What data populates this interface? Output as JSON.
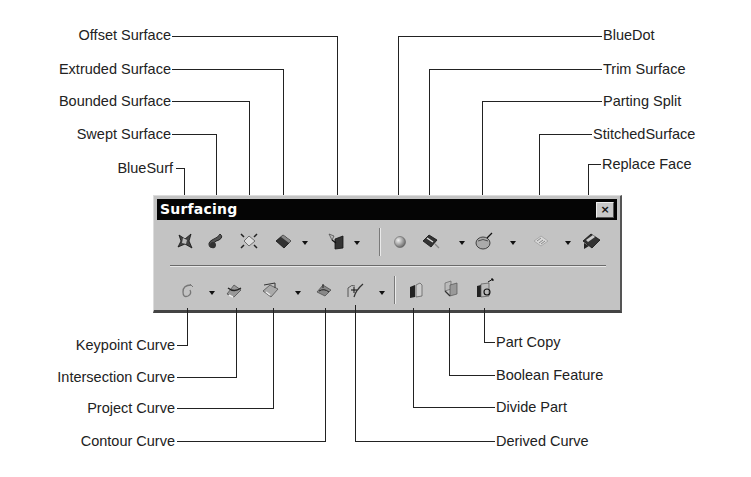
{
  "toolbar": {
    "title": "Surfacing",
    "close_glyph": "×",
    "row1": [
      {
        "name": "BlueSurf",
        "icon": "bluesurf-icon"
      },
      {
        "name": "Swept Surface",
        "icon": "swept-surface-icon"
      },
      {
        "name": "Bounded Surface",
        "icon": "bounded-surface-icon"
      },
      {
        "name": "Extruded Surface",
        "icon": "extruded-surface-icon",
        "dropdown": true
      },
      {
        "name": "Offset Surface",
        "icon": "offset-surface-icon",
        "dropdown": true
      },
      {
        "name": "BlueDot",
        "icon": "bluedot-icon"
      },
      {
        "name": "Trim Surface",
        "icon": "trim-surface-icon",
        "dropdown": true
      },
      {
        "name": "Parting Split",
        "icon": "parting-split-icon",
        "dropdown": true
      },
      {
        "name": "Stitched Surface",
        "icon": "stitched-surface-icon",
        "dropdown": true
      },
      {
        "name": "Replace Face",
        "icon": "replace-face-icon"
      }
    ],
    "row2": [
      {
        "name": "Keypoint Curve",
        "icon": "keypoint-curve-icon",
        "dropdown": true
      },
      {
        "name": "Intersection Curve",
        "icon": "intersection-curve-icon"
      },
      {
        "name": "Project Curve",
        "icon": "project-curve-icon",
        "dropdown": true
      },
      {
        "name": "Contour Curve",
        "icon": "contour-curve-icon"
      },
      {
        "name": "Derived Curve",
        "icon": "derived-curve-icon",
        "dropdown": true
      },
      {
        "name": "Divide Part",
        "icon": "divide-part-icon"
      },
      {
        "name": "Boolean Feature",
        "icon": "boolean-feature-icon"
      },
      {
        "name": "Part Copy",
        "icon": "part-copy-icon"
      }
    ]
  },
  "callouts": {
    "top_left": [
      "Offset Surface",
      "Extruded Surface",
      "Bounded Surface",
      "Swept Surface",
      "BlueSurf"
    ],
    "top_right": [
      "BlueDot",
      "Trim Surface",
      "Parting Split",
      "StitchedSurface",
      "Replace Face"
    ],
    "bottom_left": [
      "Keypoint Curve",
      "Intersection Curve",
      "Project Curve",
      "Contour Curve"
    ],
    "bottom_right": [
      "Part Copy",
      "Boolean Feature",
      "Divide Part",
      "Derived Curve"
    ]
  }
}
